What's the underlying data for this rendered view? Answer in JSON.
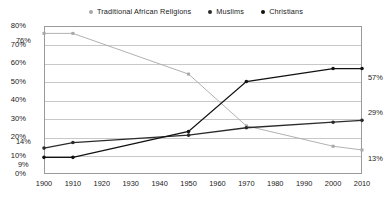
{
  "chart_data": {
    "type": "line",
    "title": "",
    "subtitle": "",
    "xlabel": "",
    "ylabel": "",
    "x": [
      1900,
      1910,
      1950,
      1970,
      2000,
      2010
    ],
    "xlim": [
      1900,
      2010
    ],
    "ylim": [
      0,
      80
    ],
    "ytick_labels": [
      "0%",
      "10%",
      "20%",
      "30%",
      "40%",
      "50%",
      "60%",
      "70%",
      "80%"
    ],
    "ytick_values": [
      0,
      10,
      20,
      30,
      40,
      50,
      60,
      70,
      80
    ],
    "xtick_labels": [
      "1900",
      "1910",
      "1920",
      "1930",
      "1940",
      "1950",
      "1960",
      "1970",
      "1980",
      "1990",
      "2000",
      "2010"
    ],
    "xtick_values": [
      1900,
      1910,
      1920,
      1930,
      1940,
      1950,
      1960,
      1970,
      1980,
      1990,
      2000,
      2010
    ],
    "grid": true,
    "legend_position": "top",
    "series": [
      {
        "name": "Traditional African Religions",
        "color": "#a8a8a8",
        "marker": "square",
        "x": [
          1900,
          1910,
          1950,
          1970,
          2000,
          2010
        ],
        "values": [
          76,
          76,
          54,
          26,
          15,
          13
        ]
      },
      {
        "name": "Muslims",
        "color": "#2b2b2b",
        "marker": "circle",
        "x": [
          1900,
          1910,
          1950,
          1970,
          2000,
          2010
        ],
        "values": [
          14,
          17,
          21,
          25,
          28,
          29
        ]
      },
      {
        "name": "Christians",
        "color": "#111111",
        "marker": "circle",
        "x": [
          1900,
          1910,
          1950,
          1970,
          2000,
          2010
        ],
        "values": [
          9,
          9,
          23,
          50,
          57,
          57
        ]
      }
    ],
    "annotations": [
      {
        "text": "76%",
        "series": "Traditional African Religions",
        "year": 1900,
        "value": 76,
        "side": "left"
      },
      {
        "text": "14%",
        "series": "Muslims",
        "year": 1900,
        "value": 14,
        "side": "left"
      },
      {
        "text": "9%",
        "series": "Christians",
        "year": 1900,
        "value": 9,
        "side": "left"
      },
      {
        "text": "57%",
        "series": "Christians",
        "year": 2010,
        "value": 57,
        "side": "right"
      },
      {
        "text": "29%",
        "series": "Muslims",
        "year": 2010,
        "value": 29,
        "side": "right"
      },
      {
        "text": "13%",
        "series": "Traditional African Religions",
        "year": 2010,
        "value": 13,
        "side": "right"
      }
    ]
  },
  "legend": {
    "items": [
      {
        "label": "Traditional African Religions",
        "color": "#a8a8a8"
      },
      {
        "label": "Muslims",
        "color": "#2b2b2b"
      },
      {
        "label": "Christians",
        "color": "#111111"
      }
    ]
  }
}
